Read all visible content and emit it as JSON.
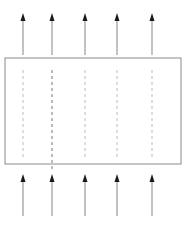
{
  "figure": {
    "name": "flow-through-porous-slab-diagram",
    "background_color": "#ffffff",
    "width": 188,
    "height": 238,
    "caption": {
      "text": "",
      "visible": false,
      "note_color": "#d8d8d8"
    },
    "slab": {
      "name": "rectangular-region",
      "x": 5,
      "y": 58,
      "width": 176,
      "height": 106,
      "stroke_color": "#8a8a8a",
      "stroke_width": 1,
      "fill_color": "#ffffff"
    },
    "columns_x": [
      23,
      52,
      85,
      117,
      152
    ],
    "dashed_lines": {
      "name": "interior-dashed-streamlines",
      "count": 5,
      "y_top": 70,
      "y_bottom": 158,
      "stroke_color": "#c9c9c9",
      "emphasis_index": 1,
      "emphasis_stroke_color": "#8f8f8f",
      "emphasis_y_bottom": 172,
      "dash_pattern": "3 3",
      "stroke_width": 1.2
    },
    "top_arrows": {
      "name": "outflow-arrows",
      "count": 5,
      "direction": "up",
      "tail_y": 55,
      "head_y": 13,
      "shaft_color": "#9a9a9a",
      "head_color": "#1a1a1a",
      "shaft_width": 1.2,
      "head_width": 5,
      "head_height": 8
    },
    "bottom_arrows": {
      "name": "inflow-arrows",
      "count": 5,
      "direction": "up",
      "tail_y": 216,
      "head_y": 174,
      "shaft_color": "#9a9a9a",
      "head_color": "#1a1a1a",
      "shaft_width": 1.2,
      "head_width": 5,
      "head_height": 8
    }
  }
}
